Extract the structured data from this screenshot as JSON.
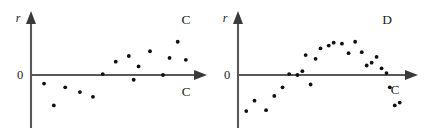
{
  "figure": {
    "title": "",
    "panels": [
      {
        "id": "C",
        "panel_label": "C",
        "y_axis_label": "r",
        "origin_label": "0",
        "x_axis_label": "C"
      },
      {
        "id": "D",
        "panel_label": "D",
        "y_axis_label": "r",
        "origin_label": "0",
        "x_axis_label": "C"
      }
    ],
    "colors": {
      "background": "#ffffff",
      "axis": "#58585a",
      "arrow": "#3a3a3c",
      "point": "#101010",
      "text": "#1b1b1b"
    }
  },
  "chart_data": [
    {
      "type": "scatter",
      "title": "C",
      "xlabel": "C",
      "ylabel": "r",
      "grid": false,
      "legend": false,
      "xlim": [
        0,
        100
      ],
      "ylim": [
        -55,
        55
      ],
      "zero_line": 0,
      "pattern": "increasing-linear-trend",
      "points": [
        {
          "x": 8,
          "y": -9
        },
        {
          "x": 14,
          "y": -32
        },
        {
          "x": 21,
          "y": -13
        },
        {
          "x": 30,
          "y": -18
        },
        {
          "x": 38,
          "y": -23
        },
        {
          "x": 44,
          "y": 1
        },
        {
          "x": 52,
          "y": 14
        },
        {
          "x": 60,
          "y": 20
        },
        {
          "x": 63,
          "y": -5
        },
        {
          "x": 66,
          "y": 9
        },
        {
          "x": 73,
          "y": 25
        },
        {
          "x": 81,
          "y": 0
        },
        {
          "x": 85,
          "y": 18
        },
        {
          "x": 90,
          "y": 35
        },
        {
          "x": 95,
          "y": 16
        }
      ]
    },
    {
      "type": "scatter",
      "title": "D",
      "xlabel": "C",
      "ylabel": "r",
      "grid": false,
      "legend": false,
      "xlim": [
        0,
        100
      ],
      "ylim": [
        -55,
        55
      ],
      "zero_line": 0,
      "pattern": "inverted-u-curvature",
      "points": [
        {
          "x": 5,
          "y": -38
        },
        {
          "x": 10,
          "y": -27
        },
        {
          "x": 17,
          "y": -37
        },
        {
          "x": 22,
          "y": -22
        },
        {
          "x": 27,
          "y": -13
        },
        {
          "x": 31,
          "y": 1
        },
        {
          "x": 36,
          "y": 0
        },
        {
          "x": 39,
          "y": 4
        },
        {
          "x": 41,
          "y": 21
        },
        {
          "x": 44,
          "y": -10
        },
        {
          "x": 47,
          "y": 17
        },
        {
          "x": 50,
          "y": 28
        },
        {
          "x": 55,
          "y": 31
        },
        {
          "x": 58,
          "y": 34
        },
        {
          "x": 63,
          "y": 33
        },
        {
          "x": 67,
          "y": 23
        },
        {
          "x": 71,
          "y": 35
        },
        {
          "x": 75,
          "y": 24
        },
        {
          "x": 78,
          "y": 10
        },
        {
          "x": 81,
          "y": 13
        },
        {
          "x": 84,
          "y": 19
        },
        {
          "x": 87,
          "y": 7
        },
        {
          "x": 90,
          "y": 2
        },
        {
          "x": 92,
          "y": -13
        },
        {
          "x": 95,
          "y": -32
        },
        {
          "x": 98,
          "y": -29
        }
      ]
    }
  ]
}
